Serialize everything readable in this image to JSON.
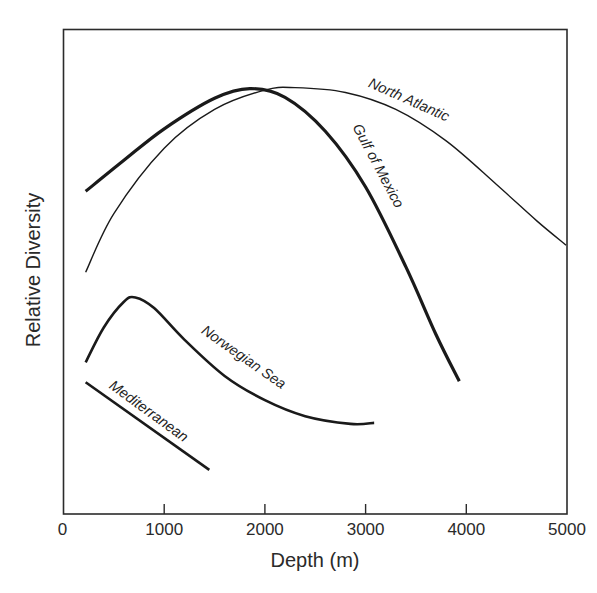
{
  "chart_data": {
    "type": "line",
    "title": "",
    "xlabel": "Depth (m)",
    "ylabel": "Relative Diversity",
    "xlim": [
      0,
      5000
    ],
    "ylim": [
      0,
      100
    ],
    "x_ticks": [
      0,
      1000,
      2000,
      3000,
      4000,
      5000
    ],
    "x_tick_labels": [
      "0",
      "1000",
      "2000",
      "3000",
      "4000",
      "5000"
    ],
    "y_ticks": [],
    "grid": false,
    "legend": "inline labels along curves",
    "series": [
      {
        "name": "North Atlantic",
        "stroke_width": 1.4,
        "points": [
          [
            220,
            49.9
          ],
          [
            500,
            62
          ],
          [
            1000,
            75.5
          ],
          [
            1500,
            83.5
          ],
          [
            2000,
            87.5
          ],
          [
            2300,
            88.0
          ],
          [
            2800,
            87.0
          ],
          [
            3300,
            83.5
          ],
          [
            3800,
            77
          ],
          [
            4300,
            68
          ],
          [
            4700,
            60.5
          ],
          [
            4990,
            55.5
          ]
        ]
      },
      {
        "name": "Gulf of Mexico",
        "stroke_width": 3.2,
        "points": [
          [
            220,
            66.6
          ],
          [
            600,
            73
          ],
          [
            1000,
            79.5
          ],
          [
            1500,
            85.8
          ],
          [
            1850,
            87.8
          ],
          [
            2200,
            86
          ],
          [
            2600,
            79
          ],
          [
            3000,
            67.5
          ],
          [
            3400,
            51
          ],
          [
            3700,
            37
          ],
          [
            3930,
            27.4
          ]
        ]
      },
      {
        "name": "Norwegian Sea",
        "stroke_width": 2.6,
        "points": [
          [
            220,
            31.3
          ],
          [
            400,
            38.5
          ],
          [
            600,
            43.8
          ],
          [
            714,
            44.7
          ],
          [
            900,
            42.5
          ],
          [
            1200,
            36
          ],
          [
            1600,
            28.5
          ],
          [
            2000,
            23.5
          ],
          [
            2400,
            20.2
          ],
          [
            2850,
            18.6
          ],
          [
            3085,
            18.8
          ]
        ]
      },
      {
        "name": "Mediterranean",
        "stroke_width": 2.6,
        "points": [
          [
            220,
            27.2
          ],
          [
            1448,
            9.1
          ]
        ]
      }
    ]
  }
}
